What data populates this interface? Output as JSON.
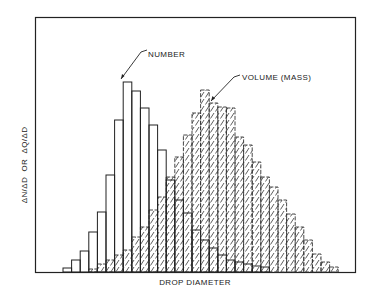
{
  "chart_data": {
    "type": "bar",
    "title": "",
    "xlabel": "DROP DIAMETER",
    "ylabel": "ΔN/ΔD  OR  ΔQ/ΔD",
    "grid": false,
    "axis_ticks": false,
    "bin_start_index": 0,
    "bin_count": 28,
    "series": [
      {
        "name": "NUMBER",
        "style": "open",
        "start_bin": 0,
        "values": [
          4,
          12,
          21,
          40,
          60,
          97,
          152,
          190,
          181,
          164,
          147,
          122,
          92,
          72,
          59,
          42,
          32,
          24,
          17,
          12,
          10,
          8,
          6,
          5
        ]
      },
      {
        "name": "VOLUME (MASS)",
        "style": "hatched",
        "start_bin": 3,
        "values": [
          3,
          8,
          12,
          17,
          22,
          35,
          45,
          62,
          75,
          95,
          115,
          137,
          159,
          182,
          169,
          165,
          164,
          135,
          127,
          110,
          95,
          85,
          72,
          58,
          45,
          32,
          18,
          10,
          5
        ]
      }
    ],
    "annotations": [
      {
        "text": "NUMBER",
        "points_to": "NUMBER peak"
      },
      {
        "text": "VOLUME (MASS)",
        "points_to": "VOLUME peak region"
      }
    ],
    "ylim": [
      0,
      255
    ],
    "legend": "none (annotations with leader arrows)"
  },
  "labels": {
    "x_axis": "DROP DIAMETER",
    "y_axis": "ΔN/ΔD  OR  ΔQ/ΔD",
    "number_annotation": "NUMBER",
    "volume_annotation": "VOLUME (MASS)"
  }
}
